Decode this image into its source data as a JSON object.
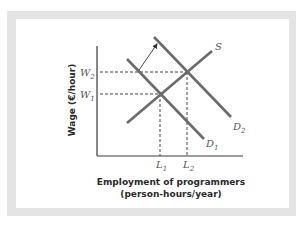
{
  "diagram": {
    "type": "supply-demand",
    "y_axis_title": "Wage (€/hour)",
    "x_axis_title_line1": "Employment of programmers",
    "x_axis_title_line2": "(person-hours/year)",
    "curves": {
      "supply": {
        "label": "S",
        "sub": ""
      },
      "demand1": {
        "label": "D",
        "sub": "1"
      },
      "demand2": {
        "label": "D",
        "sub": "2"
      }
    },
    "wages": [
      {
        "label": "W",
        "sub": "2"
      },
      {
        "label": "W",
        "sub": "1"
      }
    ],
    "quantities": [
      {
        "label": "L",
        "sub": "1"
      },
      {
        "label": "L",
        "sub": "2"
      }
    ],
    "shift": "Demand shifts right from D1 to D2",
    "colors": {
      "curve": "#6b6b6b",
      "axis": "#3a3a3a",
      "dash": "#444444",
      "frame": "#e4e4e4"
    }
  }
}
